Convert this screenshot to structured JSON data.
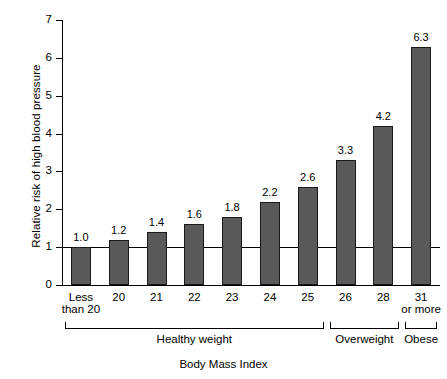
{
  "chart_data": {
    "type": "bar",
    "title": "",
    "xlabel": "Body Mass Index",
    "ylabel": "Relative risk of high blood pressure",
    "categories": [
      "Less\nthan 20",
      "20",
      "21",
      "22",
      "23",
      "24",
      "25",
      "26",
      "28",
      "31\nor more"
    ],
    "values": [
      1.0,
      1.2,
      1.4,
      1.6,
      1.8,
      2.2,
      2.6,
      3.3,
      4.2,
      6.3
    ],
    "value_labels": [
      "1.0",
      "1.2",
      "1.4",
      "1.6",
      "1.8",
      "2.2",
      "2.6",
      "3.3",
      "4.2",
      "6.3"
    ],
    "ylim": [
      0,
      7
    ],
    "yticks": [
      0,
      1,
      2,
      3,
      4,
      5,
      6,
      7
    ],
    "ytick_labels": [
      "0",
      "1",
      "2",
      "3",
      "4",
      "5",
      "6",
      "7"
    ],
    "grid": false,
    "legend": "none",
    "reference_line": {
      "value": 1,
      "label": ""
    },
    "bar_color": "#595959",
    "bar_edge_color": "#1a1a1a",
    "background_color": "#ffffff",
    "groups": [
      {
        "label": "Healthy weight",
        "first_index": 0,
        "last_index": 6
      },
      {
        "label": "Overweight",
        "first_index": 7,
        "last_index": 8
      },
      {
        "label": "Obese",
        "first_index": 9,
        "last_index": 9
      }
    ]
  }
}
